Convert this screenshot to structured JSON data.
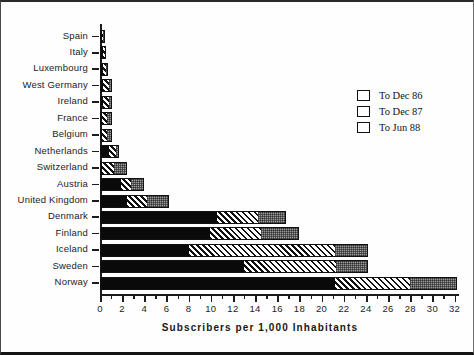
{
  "chart": {
    "type": "bar",
    "orientation": "horizontal",
    "stacked": true,
    "xlabel": "Subscribers  per  1,000  Inhabitants",
    "ylabel": "",
    "title": "",
    "xlim": [
      0,
      32.6
    ],
    "grid": false,
    "legend_position": "upper-right"
  },
  "legend": {
    "items": [
      {
        "label": "To Dec 86",
        "swatch": "solid-black",
        "color": "#0a0a0a"
      },
      {
        "label": "To Dec 87",
        "swatch": "diagonal-hatch",
        "color": "#ffffff"
      },
      {
        "label": "To Jun 88",
        "swatch": "dotted-grey",
        "color": "#9a9a9a"
      }
    ]
  },
  "axis": {
    "ticks": [
      {
        "value": 0,
        "label": "0"
      },
      {
        "value": 2,
        "label": "2"
      },
      {
        "value": 4,
        "label": "4"
      },
      {
        "value": 6,
        "label": "6"
      },
      {
        "value": 8,
        "label": "8"
      },
      {
        "value": 10,
        "label": "10"
      },
      {
        "value": 12,
        "label": "12"
      },
      {
        "value": 14,
        "label": "14"
      },
      {
        "value": 16,
        "label": "16"
      },
      {
        "value": 18,
        "label": "18"
      },
      {
        "value": 20,
        "label": "20"
      },
      {
        "value": 22,
        "label": "22"
      },
      {
        "value": 24,
        "label": "24"
      },
      {
        "value": 26,
        "label": "26"
      },
      {
        "value": 28,
        "label": "28"
      },
      {
        "value": 30,
        "label": "30"
      },
      {
        "value": 32,
        "label": "32"
      }
    ],
    "minor_ticks": [
      1,
      3,
      5,
      7,
      9,
      11,
      13,
      15,
      17,
      19,
      21,
      23,
      25,
      27,
      29,
      31
    ]
  },
  "chart_data": {
    "type": "bar",
    "title": "",
    "xlabel": "Subscribers per 1,000 Inhabitants",
    "ylabel": "",
    "xlim": [
      0,
      32.6
    ],
    "grid": false,
    "legend_position": "upper-right",
    "orientation": "horizontal",
    "stacked": true,
    "categories": [
      "Spain",
      "Italy",
      "Luxembourg",
      "West Germany",
      "Ireland",
      "France",
      "Belgium",
      "Netherlands",
      "Switzerland",
      "Austria",
      "United Kingdom",
      "Denmark",
      "Finland",
      "Iceland",
      "Sweden",
      "Norway"
    ],
    "series": [
      {
        "name": "To Dec 86",
        "values": [
          0.1,
          0.3,
          0.3,
          0.3,
          0.3,
          0.2,
          0.2,
          0.8,
          0.2,
          1.9,
          2.4,
          10.6,
          9.9,
          8.0,
          13.0,
          21.2
        ]
      },
      {
        "name": "To Dec 87",
        "values": [
          0.05,
          0.1,
          0.2,
          0.5,
          0.5,
          0.4,
          0.4,
          0.6,
          1.1,
          0.9,
          1.8,
          3.7,
          4.6,
          13.2,
          8.3,
          6.8
        ]
      },
      {
        "name": "To Jun 88",
        "values": [
          0.05,
          0.1,
          0.2,
          0.3,
          0.3,
          0.5,
          0.5,
          0.3,
          1.1,
          1.2,
          2.0,
          2.5,
          3.5,
          3.0,
          2.9,
          4.2
        ]
      }
    ],
    "totals": [
      0.2,
      0.5,
      0.7,
      1.1,
      1.1,
      1.1,
      1.1,
      1.7,
      2.4,
      4.0,
      6.2,
      16.8,
      18.0,
      24.2,
      24.2,
      32.2
    ]
  }
}
